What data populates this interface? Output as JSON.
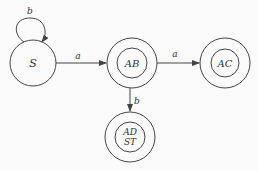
{
  "diagram": {
    "type": "state-machine",
    "background": "#fafafa",
    "stroke": "#444444",
    "states": [
      {
        "id": "S",
        "label": "S",
        "accepting": false
      },
      {
        "id": "AB",
        "label": "AB",
        "accepting": true
      },
      {
        "id": "AC",
        "label": "AC",
        "accepting": true
      },
      {
        "id": "ADST",
        "label_line1": "AD",
        "label_line2": "ST",
        "accepting": true
      }
    ],
    "transitions": [
      {
        "from": "S",
        "to": "S",
        "label": "b"
      },
      {
        "from": "S",
        "to": "AB",
        "label": "a"
      },
      {
        "from": "AB",
        "to": "AC",
        "label": "a"
      },
      {
        "from": "AB",
        "to": "ADST",
        "label": "b"
      }
    ]
  }
}
